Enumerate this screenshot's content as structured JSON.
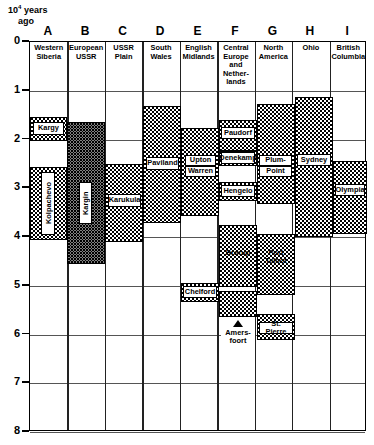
{
  "axis": {
    "caption_main": "10",
    "caption_exp": "4",
    "caption_unit": "years",
    "caption_ago": "ago",
    "ticks": [
      "0",
      "1",
      "2",
      "3",
      "4",
      "5",
      "6",
      "7",
      "8"
    ]
  },
  "columns": [
    {
      "letter": "A",
      "name": "Western\nSiberia"
    },
    {
      "letter": "B",
      "name": "European\nUSSR"
    },
    {
      "letter": "C",
      "name": "USSR\nPlain"
    },
    {
      "letter": "D",
      "name": "South\nWales"
    },
    {
      "letter": "E",
      "name": "English\nMidlands"
    },
    {
      "letter": "F",
      "name": "Central\nEurope\nand\nNether-\nlands"
    },
    {
      "letter": "G",
      "name": "North\nAmerica"
    },
    {
      "letter": "H",
      "name": "Ohio"
    },
    {
      "letter": "I",
      "name": "British\nColumbia"
    }
  ],
  "labels": {
    "kargy": "Kargy",
    "kolpachevo": "Kolpachevo",
    "kargin": "Kargin",
    "karukula": "Karukula",
    "paviland": "Paviland",
    "upton": "Upton",
    "warren": "Warren",
    "upton_warren": "Upton\nWarren",
    "paudorf": "Paudorf",
    "denekamp": "Denekamp",
    "hengelo": "Hengelo",
    "plum": "Plum-",
    "point": "Point",
    "plum_point": "Plum-\nPoint",
    "sydney": "Sydney",
    "olympia": "Olympia",
    "port_talbot": "Port\nTalbot",
    "chelford": "Chelford",
    "brorup": "Brørup",
    "amersfoort": "Amers-\nfoort",
    "st_pierre": "St. Pierre"
  },
  "chart_data": {
    "type": "table",
    "ylabel": "10⁴ years ago",
    "ylim": [
      0,
      8
    ],
    "yaxis_inverted": true,
    "grid": true,
    "legend": "none",
    "categories": [
      "A",
      "B",
      "C",
      "D",
      "E",
      "F",
      "G",
      "H",
      "I"
    ],
    "series": [
      {
        "name": "Western Siberia",
        "column": "A",
        "bands": [
          {
            "label": "Kargy",
            "from": 2.35,
            "to": 2.85
          },
          {
            "label": "Kolpachevo",
            "from": 3.4,
            "to": 4.95
          }
        ]
      },
      {
        "name": "European USSR",
        "column": "B",
        "bands": [
          {
            "label": "Kargin",
            "from": 2.45,
            "to": 5.45
          }
        ]
      },
      {
        "name": "USSR Plain",
        "column": "C",
        "bands": [
          {
            "label": "Karukula",
            "from": 3.35,
            "to": 5.0
          }
        ]
      },
      {
        "name": "South Wales",
        "column": "D",
        "bands": [
          {
            "label": "Paviland",
            "from": 2.15,
            "to": 4.6
          }
        ]
      },
      {
        "name": "English Midlands",
        "column": "E",
        "bands": [
          {
            "label": "Upton Warren",
            "from": 2.6,
            "to": 4.45
          },
          {
            "label": "Chelford",
            "from": 5.85,
            "to": 6.25
          }
        ]
      },
      {
        "name": "Central Europe and Netherlands",
        "column": "F",
        "bands": [
          {
            "label": "Paudorf",
            "from": 2.4,
            "to": 3.05
          },
          {
            "label": "Denekamp",
            "from": 3.05,
            "to": 3.35
          },
          {
            "label": "Hengelo",
            "from": 3.7,
            "to": 4.1
          },
          {
            "label": "Brørup",
            "from": 5.0,
            "to": 6.3
          },
          {
            "label": "Amersfoort",
            "from": 6.4,
            "to": 6.95
          }
        ]
      },
      {
        "name": "North America",
        "column": "G",
        "bands": [
          {
            "label": "Plum-Point",
            "from": 2.1,
            "to": 4.15
          },
          {
            "label": "Port Talbot",
            "from": 4.75,
            "to": 6.0
          },
          {
            "label": "St. Pierre",
            "from": 6.4,
            "to": 6.95
          }
        ]
      },
      {
        "name": "Ohio",
        "column": "H",
        "bands": [
          {
            "label": "Sydney",
            "from": 1.95,
            "to": 4.9
          }
        ]
      },
      {
        "name": "British Columbia",
        "column": "I",
        "bands": [
          {
            "label": "Olympia",
            "from": 3.3,
            "to": 4.85
          }
        ]
      }
    ]
  }
}
